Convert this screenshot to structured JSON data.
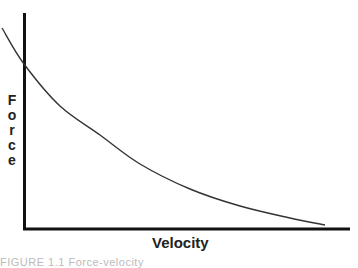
{
  "chart_data": {
    "type": "line",
    "title": "",
    "xlabel": "Velocity",
    "ylabel": "Force",
    "ylabel_letters": [
      "F",
      "o",
      "r",
      "c",
      "e"
    ],
    "grid": false,
    "legend": null,
    "ticks": {
      "x": [],
      "y": []
    },
    "series": [
      {
        "name": "force-velocity curve",
        "description": "Hyperbolic decreasing relationship: force decreases as velocity increases",
        "pixel_points": [
          [
            2,
            28
          ],
          [
            24,
            64
          ],
          [
            60,
            106
          ],
          [
            100,
            135
          ],
          [
            140,
            164
          ],
          [
            190,
            189
          ],
          [
            240,
            206
          ],
          [
            290,
            218
          ],
          [
            325,
            225
          ]
        ],
        "normalized_points": [
          {
            "x": -0.07,
            "y": 1.07
          },
          {
            "x": 0.0,
            "y": 0.86
          },
          {
            "x": 0.11,
            "y": 0.62
          },
          {
            "x": 0.23,
            "y": 0.45
          },
          {
            "x": 0.36,
            "y": 0.28
          },
          {
            "x": 0.51,
            "y": 0.14
          },
          {
            "x": 0.66,
            "y": 0.04
          },
          {
            "x": 0.82,
            "y": -0.02
          },
          {
            "x": 0.92,
            "y": -0.06
          }
        ]
      }
    ],
    "axes": {
      "origin_px": [
        24,
        229
      ],
      "x_end_px": 350,
      "y_top_px": 13
    },
    "colors": {
      "axis": "#111111",
      "curve": "#333333",
      "text": "#222222"
    }
  },
  "caption": "FIGURE 1.1   Force-velocity"
}
